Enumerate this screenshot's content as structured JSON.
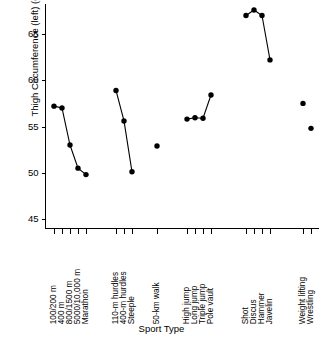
{
  "chart_data": {
    "type": "scatter",
    "title": "",
    "xlabel": "Sport Type",
    "ylabel": "Thigh Circumference (left) (cm)",
    "ylim": [
      44,
      68.4
    ],
    "yticks": [
      45,
      50,
      55,
      60,
      65
    ],
    "ytick_labels": [
      "45",
      "50",
      "55",
      "60",
      "65"
    ],
    "grid": false,
    "legend": "none",
    "categories": [
      "100/200 m",
      "400 m",
      "800/1500 m",
      "5000/10,000 m",
      "Marathon",
      "110-m hurdles",
      "400-m hurdles",
      "Steeple",
      "50-km walk",
      "High jump",
      "Long jump",
      "Triple jump",
      "Pole vault",
      "Shot",
      "Discus",
      "Hammer",
      "Javelin",
      "Weight lifting",
      "Wrestling"
    ],
    "values": [
      57.2,
      57.0,
      53.0,
      50.5,
      49.8,
      58.9,
      55.6,
      50.1,
      52.9,
      55.8,
      55.95,
      55.9,
      58.4,
      67.0,
      67.6,
      67.0,
      62.2,
      57.5,
      54.8
    ],
    "groups": [
      {
        "name": "track-running",
        "connected": true,
        "indices": [
          0,
          1,
          2,
          3,
          4
        ]
      },
      {
        "name": "hurdles-steeple",
        "connected": true,
        "indices": [
          5,
          6,
          7
        ]
      },
      {
        "name": "race-walk",
        "connected": false,
        "indices": [
          8
        ]
      },
      {
        "name": "jumps",
        "connected": true,
        "indices": [
          9,
          10,
          11,
          12
        ]
      },
      {
        "name": "throws",
        "connected": true,
        "indices": [
          13,
          14,
          15,
          16
        ]
      },
      {
        "name": "strength-sports",
        "connected": false,
        "indices": [
          17,
          18
        ]
      }
    ],
    "marker": "filled-circle",
    "marker_color": "#000000",
    "line_color": "#000000"
  },
  "axes": {
    "y_title": "Thigh Circumference (left) (cm)",
    "x_title": "Sport Type"
  }
}
